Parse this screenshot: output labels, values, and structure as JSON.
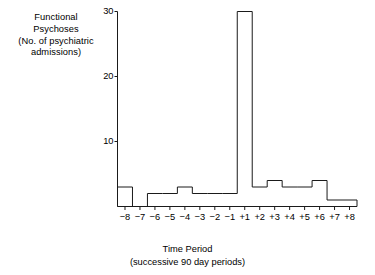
{
  "chart_data": {
    "type": "bar",
    "title": "",
    "ylabel_lines": [
      "Functional",
      "Psychoses",
      "(No. of psychiatric",
      "admissions)"
    ],
    "xlabel_lines": [
      "Time Period",
      "(successive 90 day periods)"
    ],
    "categories": [
      "-8",
      "-7",
      "-6",
      "-5",
      "-4",
      "-3",
      "-2",
      "-1",
      "+1",
      "+2",
      "+3",
      "+4",
      "+5",
      "+6",
      "+7",
      "+8"
    ],
    "values": [
      3,
      0,
      2,
      2,
      3,
      2,
      2,
      2,
      30,
      3,
      4,
      3,
      3,
      4,
      1,
      1
    ],
    "ylim": [
      0,
      30
    ],
    "yticks": [
      10,
      20,
      30
    ],
    "ytick_labels": [
      "10",
      "20",
      "30"
    ],
    "xlim_note": "16 successive 90-day periods, 8 before and 8 after the index event",
    "grid": false,
    "legend": false,
    "bar_style": "step-outline",
    "line_color": "#1a1a1a",
    "background_color": "#ffffff"
  },
  "axis": {
    "y_axis_name": "y-axis-line",
    "x_axis_name": "x-axis-line"
  }
}
